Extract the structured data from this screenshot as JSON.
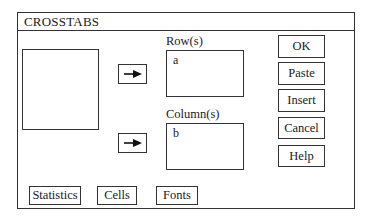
{
  "window": {
    "title": "CROSSTABS"
  },
  "source_list": {
    "items": []
  },
  "rows": {
    "label": "Row(s)",
    "items": [
      "a"
    ]
  },
  "columns": {
    "label": "Column(s)",
    "items": [
      "b"
    ]
  },
  "arrow_buttons": [
    {
      "icon": "arrow-right-icon",
      "target": "rows"
    },
    {
      "icon": "arrow-right-icon",
      "target": "columns"
    }
  ],
  "actions": {
    "ok": "OK",
    "paste": "Paste",
    "insert": "Insert",
    "cancel": "Cancel",
    "help": "Help"
  },
  "bottom_buttons": {
    "statistics": "Statistics",
    "cells": "Cells",
    "fonts": "Fonts"
  }
}
